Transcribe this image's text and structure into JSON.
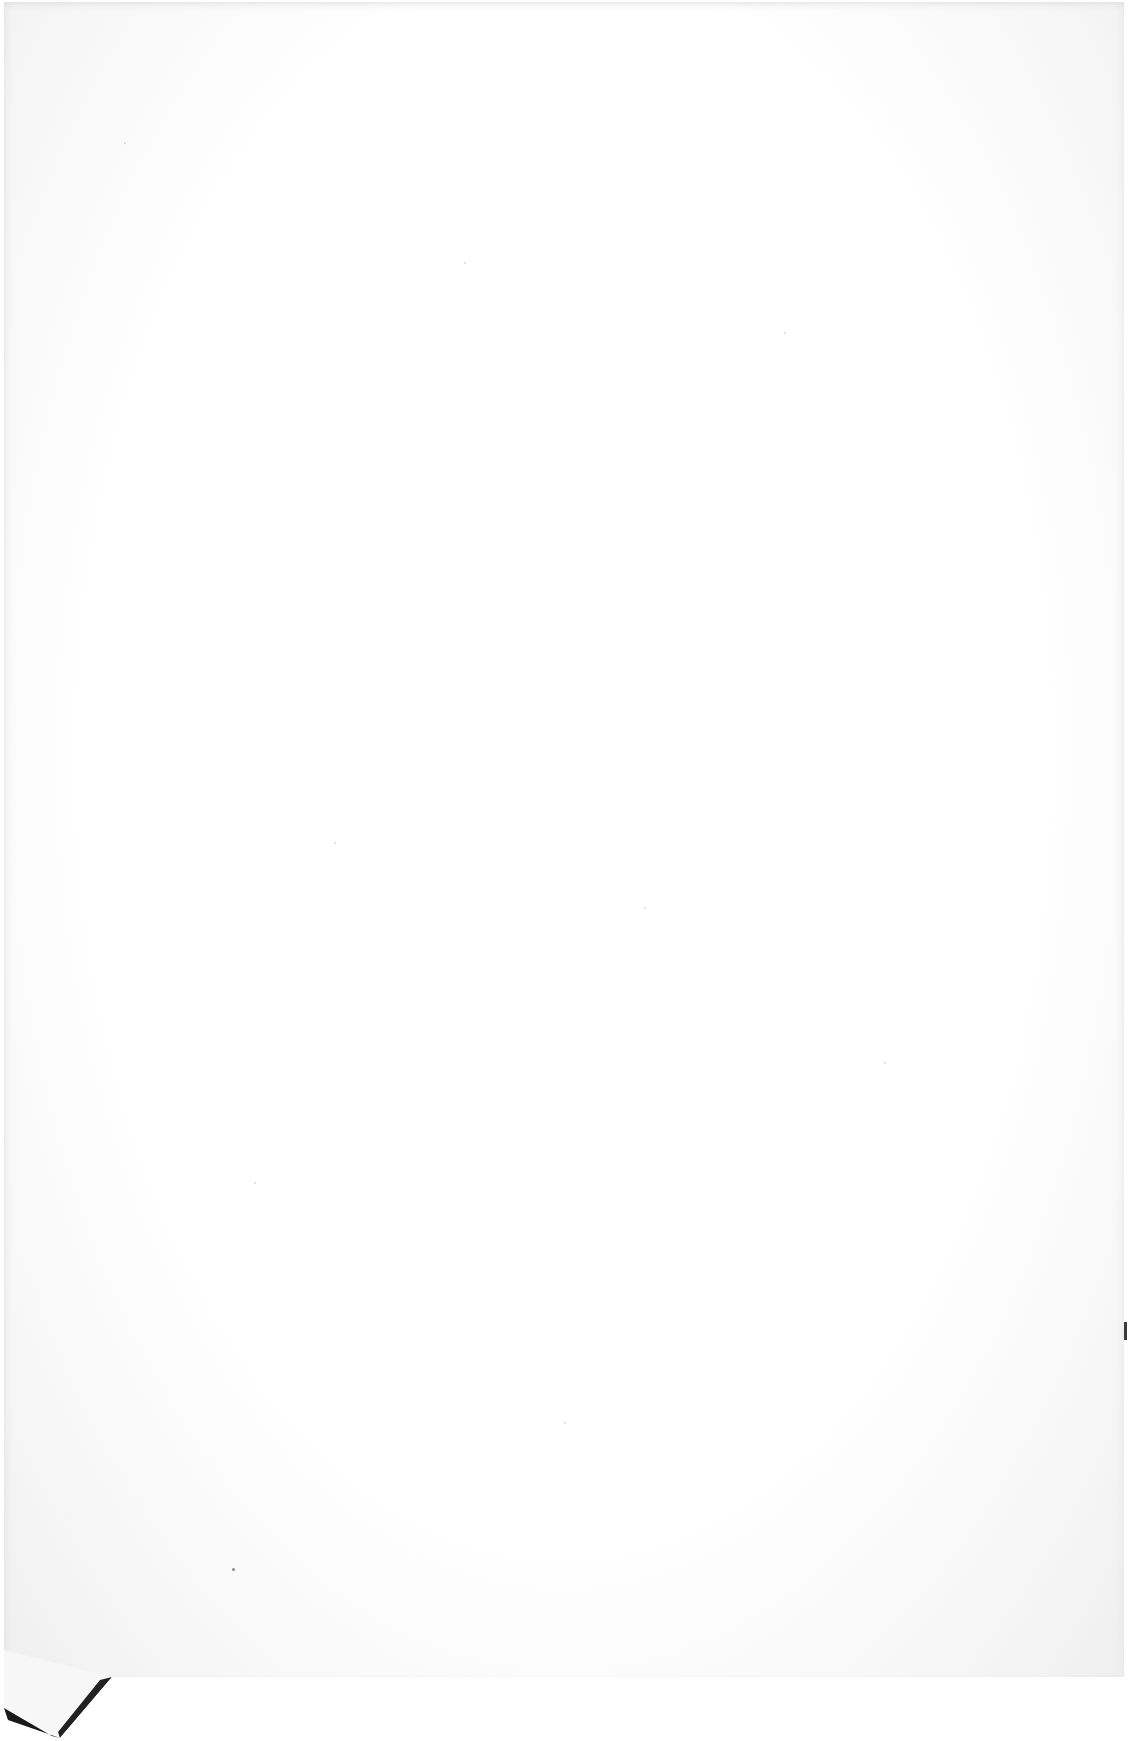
{
  "page": {
    "type": "blank-scanned-sheet",
    "content_text": "",
    "colors": {
      "paper": "#ffffff",
      "edge_shadow": "#e6e6e6",
      "fold_shadow": "#1a1a1a"
    },
    "features": [
      "paper-texture",
      "folded-corner-bottom-left"
    ]
  }
}
